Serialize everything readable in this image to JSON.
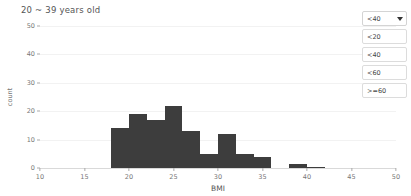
{
  "header": {
    "title": "20 ~ 39 years old"
  },
  "filter": {
    "selected_label": "<40",
    "caret_icon": "chevron-down-icon",
    "options": [
      {
        "label": "<20"
      },
      {
        "label": "<40"
      },
      {
        "label": "<60"
      },
      {
        "label": ">=60"
      }
    ]
  },
  "chart_data": {
    "type": "bar",
    "title": "20 ~ 39 years old",
    "xlabel": "BMI",
    "ylabel": "count",
    "xlim": [
      10,
      50
    ],
    "ylim": [
      0,
      50
    ],
    "xticks": [
      10,
      15,
      20,
      25,
      30,
      35,
      40,
      45,
      50
    ],
    "yticks": [
      0,
      10,
      20,
      30,
      40,
      50
    ],
    "grid": true,
    "legend": "none",
    "bar_color": "#3d3d3d",
    "bin_width": 2,
    "bin_starts": [
      18,
      20,
      22,
      24,
      26,
      28,
      30,
      32,
      34,
      36,
      38,
      40
    ],
    "categories": [
      "18-20",
      "20-22",
      "22-24",
      "24-26",
      "26-28",
      "28-30",
      "30-32",
      "32-34",
      "34-36",
      "36-38",
      "38-40",
      "40-42"
    ],
    "values": [
      14,
      19,
      17,
      22,
      13,
      5,
      12,
      5,
      4,
      0,
      1.5,
      0.5
    ]
  }
}
